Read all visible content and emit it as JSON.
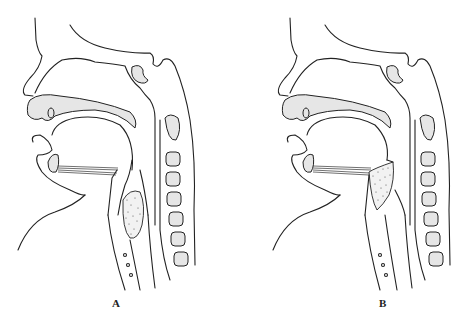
{
  "figure": {
    "type": "anatomical sagittal illustration",
    "panels": [
      {
        "id": "A",
        "label": "A",
        "subject": "sagittal head and neck section",
        "highlight": "stippled mass below epiglottis in the laryngopharynx"
      },
      {
        "id": "B",
        "label": "B",
        "subject": "sagittal head and neck section",
        "highlight": "stippled triangular mass at the tongue base / epiglottis region"
      }
    ]
  },
  "colors": {
    "background": "#ffffff",
    "line": "#222222",
    "bone_fill": "#e6e6e6",
    "stipple": "#333333"
  }
}
